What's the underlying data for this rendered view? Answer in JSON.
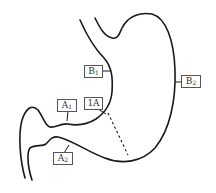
{
  "diagram": {
    "labels": [
      {
        "id": "B1",
        "main": "B",
        "sub": "1"
      },
      {
        "id": "B2",
        "main": "B",
        "sub": "2"
      },
      {
        "id": "A1",
        "main": "A",
        "sub": "1"
      },
      {
        "id": "1A",
        "main": "1A",
        "sub": ""
      },
      {
        "id": "A2",
        "main": "A",
        "sub": "2"
      }
    ],
    "colors": {
      "stroke": "#1a1a1a",
      "label_border": "#555555"
    }
  }
}
